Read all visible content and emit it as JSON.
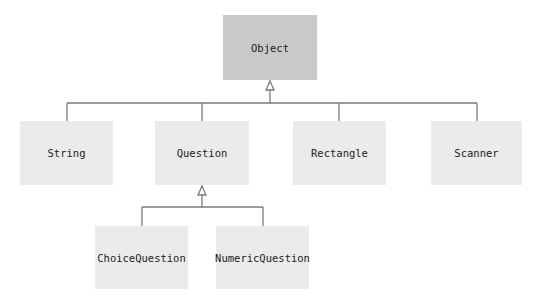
{
  "diagram": {
    "type": "class-hierarchy",
    "colors": {
      "root_fill": "#c9c9c9",
      "node_fill": "#ebebeb",
      "line": "#7a7a7a",
      "text": "#222222"
    },
    "nodes": [
      {
        "id": "object",
        "label": "Object",
        "x": 223,
        "y": 15,
        "w": 94,
        "h": 65,
        "root": true
      },
      {
        "id": "string",
        "label": "String",
        "x": 20,
        "y": 121,
        "w": 93,
        "h": 64
      },
      {
        "id": "question",
        "label": "Question",
        "x": 155,
        "y": 121,
        "w": 94,
        "h": 64
      },
      {
        "id": "rectangle",
        "label": "Rectangle",
        "x": 293,
        "y": 121,
        "w": 93,
        "h": 64
      },
      {
        "id": "scanner",
        "label": "Scanner",
        "x": 431,
        "y": 121,
        "w": 91,
        "h": 64
      },
      {
        "id": "choicequestion",
        "label": "ChoiceQuestion",
        "x": 95,
        "y": 226,
        "w": 93,
        "h": 63
      },
      {
        "id": "numericquestion",
        "label": "NumericQuestion",
        "x": 216,
        "y": 226,
        "w": 93,
        "h": 63
      }
    ],
    "edges": [
      {
        "from": "string",
        "to": "object"
      },
      {
        "from": "question",
        "to": "object"
      },
      {
        "from": "rectangle",
        "to": "object"
      },
      {
        "from": "scanner",
        "to": "object"
      },
      {
        "from": "choicequestion",
        "to": "question"
      },
      {
        "from": "numericquestion",
        "to": "question"
      }
    ]
  }
}
